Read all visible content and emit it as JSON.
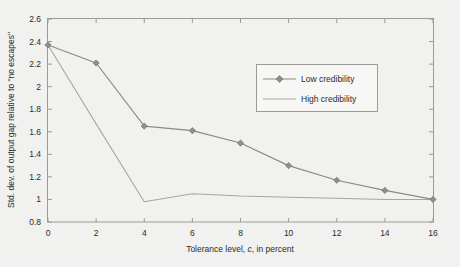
{
  "chart_data": {
    "type": "line",
    "title": "",
    "xlabel_parts": {
      "before": "Tolerance level, ",
      "italic": "c",
      "after": ", in percent"
    },
    "xlabel": "Tolerance level, c, in percent",
    "ylabel": "Std. dev. of output gap relative to \"no escapes\"",
    "x": [
      0,
      2,
      4,
      6,
      8,
      10,
      12,
      14,
      16
    ],
    "xlim": [
      0,
      16
    ],
    "ylim": [
      0.8,
      2.6
    ],
    "xticks": [
      0,
      2,
      4,
      6,
      8,
      10,
      12,
      14,
      16
    ],
    "xtick_labels": [
      "0",
      "2",
      "4",
      "6",
      "8",
      "10",
      "12",
      "14",
      "16"
    ],
    "yticks": [
      0.8,
      1.0,
      1.2,
      1.4,
      1.6,
      1.8,
      2.0,
      2.2,
      2.4,
      2.6
    ],
    "ytick_labels": [
      "0.8",
      "1",
      "1.2",
      "1.4",
      "1.6",
      "1.8",
      "2",
      "2.2",
      "2.4",
      "2.6"
    ],
    "grid": false,
    "legend_position": "upper-right",
    "series": [
      {
        "name": "Low credibility",
        "marker": "diamond",
        "values": [
          2.37,
          2.21,
          1.65,
          1.61,
          1.5,
          1.3,
          1.17,
          1.08,
          1.0
        ]
      },
      {
        "name": "High credibility",
        "marker": "none",
        "values": [
          2.37,
          1.67,
          0.98,
          1.05,
          1.03,
          1.02,
          1.01,
          1.0,
          1.0
        ]
      }
    ]
  },
  "legend": {
    "entries": [
      {
        "label": "Low credibility"
      },
      {
        "label": "High credibility"
      }
    ]
  }
}
